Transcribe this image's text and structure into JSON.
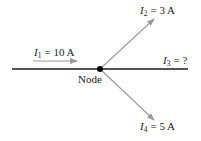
{
  "diagram": {
    "colors": {
      "wire": "#1a1a1a",
      "arrow": "#9a9a9a",
      "node": "#000000",
      "text": "#222222"
    },
    "node_label": "Node",
    "currents": [
      {
        "symbol": "I",
        "sub": "1",
        "value": "= 10 A",
        "direction": "into node, along wire from left"
      },
      {
        "symbol": "I",
        "sub": "2",
        "value": "= 3 A",
        "direction": "out, up-right"
      },
      {
        "symbol": "I",
        "sub": "3",
        "value": "= ?",
        "direction": "out, along wire to right"
      },
      {
        "symbol": "I",
        "sub": "4",
        "value": "= 5 A",
        "direction": "out, down-right"
      }
    ]
  }
}
